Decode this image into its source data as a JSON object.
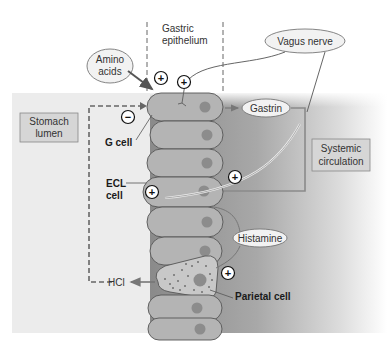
{
  "regions": {
    "stomach_lumen": "Stomach\nlumen",
    "stomach_lumen_l1": "Stomach",
    "stomach_lumen_l2": "lumen",
    "gastric_epithelium_l1": "Gastric",
    "gastric_epithelium_l2": "epithelium",
    "systemic_l1": "Systemic",
    "systemic_l2": "circulation"
  },
  "ovals": {
    "amino_l1": "Amino",
    "amino_l2": "acids",
    "vagus": "Vagus nerve",
    "gastrin": "Gastrin",
    "histamine": "Histamine"
  },
  "cells": {
    "g_cell": "G cell",
    "ecl_l1": "ECL",
    "ecl_l2": "cell",
    "parietal": "Parietal cell"
  },
  "products": {
    "hcl": "HCl"
  },
  "signs": {
    "plus": "+",
    "minus": "−"
  },
  "colors": {
    "lumen_bg": "#ececec",
    "interstitial_dark": "#8f8f8f",
    "cell_fill": "#b4b4b4",
    "nucleus": "#8c8c8c",
    "oval_fill": "#f2f2f2",
    "box_fill": "#d6d6d6"
  }
}
